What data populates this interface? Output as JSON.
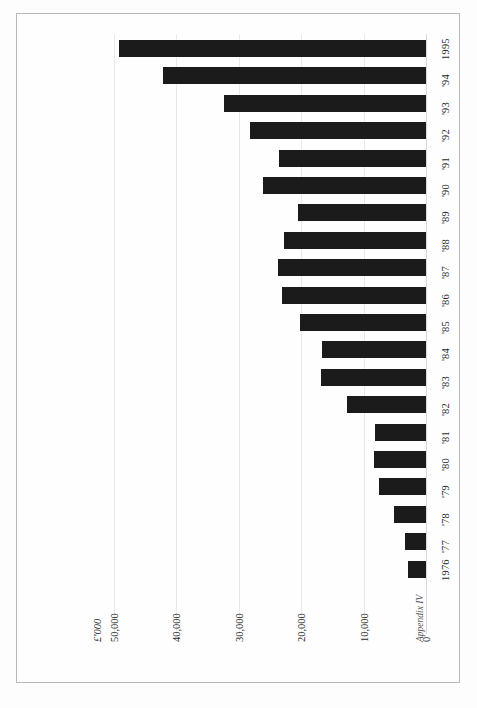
{
  "page": {
    "footer_note": "Appendix IV"
  },
  "chart_data": {
    "type": "bar",
    "orientation": "horizontal-rotated",
    "title": "",
    "subtitle": "",
    "xlabel": "",
    "ylabel": "£'000",
    "unit_label": "£'000",
    "categories": [
      "1976",
      "'77",
      "'78",
      "'79",
      "'80",
      "'81",
      "'82",
      "'83",
      "'84",
      "'85",
      "'86",
      "'87",
      "'88",
      "'89",
      "'90",
      "'91",
      "'92",
      "'93",
      "'94",
      "1995"
    ],
    "values": [
      2900,
      3300,
      5100,
      7600,
      8400,
      8100,
      12600,
      16800,
      16700,
      20100,
      23100,
      23700,
      22700,
      20500,
      26100,
      23500,
      28200,
      32300,
      42100,
      49100
    ],
    "axis_ticks": [
      "50,000",
      "40,000",
      "30,000",
      "20,000",
      "10,000",
      "0"
    ],
    "axis_tick_values": [
      50000,
      40000,
      30000,
      20000,
      10000,
      0
    ],
    "xlim": [
      0,
      52000
    ],
    "grid": true,
    "legend": "none",
    "bar_color": "#1b1b1b",
    "grid_color": "#e9e9e9"
  }
}
